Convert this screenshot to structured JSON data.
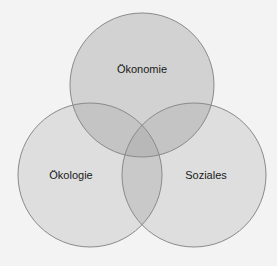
{
  "diagram": {
    "type": "venn",
    "colors": {
      "background": "#f3f3f3",
      "circle_fill": "#dedede",
      "top_circle_fill": "#d2d2d2",
      "overlap_fill": "#bfbfbf",
      "center_fill": "#b3b3b3",
      "stroke": "#8a8a8a"
    },
    "circles": [
      {
        "id": "oekonomie",
        "label": "Ökonomie",
        "cx": 142,
        "cy": 85,
        "r": 72,
        "label_x": 142,
        "label_y": 69
      },
      {
        "id": "oekologie",
        "label": "Ökologie",
        "cx": 90,
        "cy": 175,
        "r": 72,
        "label_x": 71,
        "label_y": 175
      },
      {
        "id": "soziales",
        "label": "Soziales",
        "cx": 194,
        "cy": 175,
        "r": 72,
        "label_x": 206,
        "label_y": 175
      }
    ]
  }
}
